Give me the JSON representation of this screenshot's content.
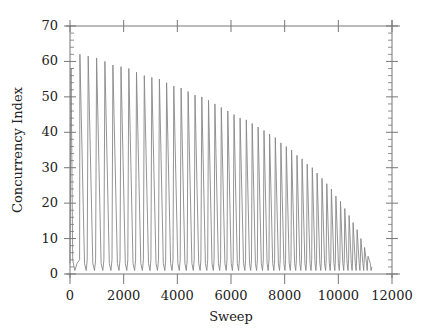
{
  "chart_data": {
    "type": "line",
    "title": "",
    "xlabel": "Sweep",
    "ylabel": "Concurrency Index",
    "xlim": [
      0,
      12000
    ],
    "ylim": [
      0,
      70
    ],
    "xticks": [
      0,
      2000,
      4000,
      6000,
      8000,
      10000,
      12000
    ],
    "yticks": [
      0,
      10,
      20,
      30,
      40,
      50,
      60,
      70
    ],
    "grid": false,
    "legend": null,
    "line_color": "#888888",
    "series": [
      {
        "name": "Concurrency Index",
        "description": "Oscillating sawtooth: repeated spikes from ~1 up to a decaying envelope, spacing narrowing with sweep",
        "initial_spike": {
          "x": 40,
          "y": 58
        },
        "trough_value": 1,
        "peaks": {
          "x": [
            370,
            680,
            990,
            1300,
            1600,
            1900,
            2190,
            2480,
            2770,
            3050,
            3330,
            3600,
            3870,
            4140,
            4400,
            4660,
            4910,
            5160,
            5400,
            5640,
            5880,
            6110,
            6340,
            6570,
            6790,
            7010,
            7230,
            7440,
            7650,
            7860,
            8060,
            8260,
            8460,
            8650,
            8840,
            9030,
            9210,
            9390,
            9570,
            9740,
            9910,
            10080,
            10240,
            10400,
            10550,
            10700,
            10840,
            10980,
            11110
          ],
          "y": [
            62,
            61.5,
            61,
            60,
            59,
            58.5,
            58,
            57,
            56,
            55.5,
            55,
            54,
            53,
            52.5,
            51.5,
            50.5,
            50,
            49,
            48,
            47,
            46,
            45,
            44,
            43.5,
            42.5,
            41.5,
            40.5,
            39.5,
            38.5,
            37,
            36,
            35,
            33.5,
            32.5,
            31,
            30,
            28.5,
            27,
            25.5,
            24,
            22,
            20.5,
            18.5,
            16.5,
            14.5,
            12.5,
            10,
            7.5,
            5
          ]
        }
      }
    ]
  }
}
